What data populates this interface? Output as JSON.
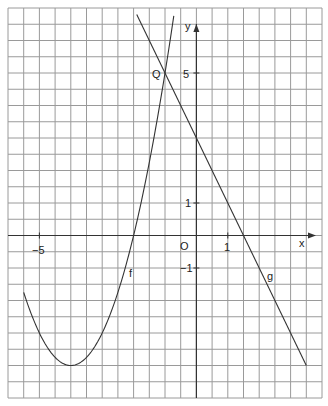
{
  "chart_data": {
    "type": "line",
    "title": "",
    "xlabel": "x",
    "ylabel": "y",
    "xlim": [
      -6,
      4
    ],
    "ylim": [
      -5,
      7
    ],
    "grid": true,
    "grid_step": 0.5,
    "tick_labels": {
      "x": [
        {
          "value": -5,
          "label": "-5"
        },
        {
          "value": 1,
          "label": "1"
        }
      ],
      "y": [
        {
          "value": 5,
          "label": "5"
        },
        {
          "value": 1,
          "label": "1"
        },
        {
          "value": -1,
          "label": "-1"
        }
      ],
      "origin": "O"
    },
    "series": [
      {
        "name": "f",
        "kind": "parabola",
        "equation": "f(x) = (x+4)^2 - 4",
        "vertex": [
          -4,
          -4
        ],
        "x_range": [
          -5.5,
          -0.72
        ],
        "label_at": [
          -2.3,
          -1.2
        ]
      },
      {
        "name": "g",
        "kind": "line",
        "equation": "g(x) = -2x + 3",
        "x_range": [
          -1.9,
          3.5
        ],
        "label_at": [
          2.35,
          -1.3
        ]
      }
    ],
    "annotations": [
      {
        "text": "Q",
        "point": [
          -1,
          5
        ],
        "description": "intersection of f and g"
      }
    ]
  },
  "labels": {
    "x_axis": "x",
    "y_axis": "y",
    "origin": "O",
    "x_minus5": "−5",
    "x_one": "1",
    "y_five": "5",
    "y_one": "1",
    "y_minus1": "−1",
    "point_q": "Q",
    "curve_f": "f",
    "curve_g": "g"
  }
}
